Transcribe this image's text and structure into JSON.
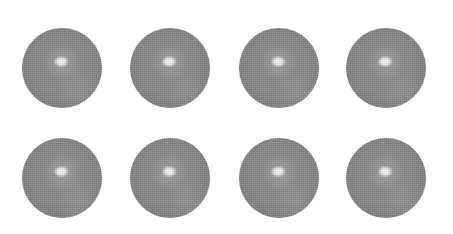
{
  "scene": {
    "description": "Eight gray glossy spheres arranged in a 2x4 grid on a white background",
    "background_color": "#ffffff",
    "sphere_color": "#8c8c8c",
    "highlight_color": "#ffffff",
    "sphere_diameter": 80,
    "rows": 2,
    "columns": 4
  },
  "spheres": [
    {
      "row": 1,
      "col": 1,
      "cx": 62,
      "cy": 68
    },
    {
      "row": 1,
      "col": 2,
      "cx": 170,
      "cy": 68
    },
    {
      "row": 1,
      "col": 3,
      "cx": 279,
      "cy": 68
    },
    {
      "row": 1,
      "col": 4,
      "cx": 386,
      "cy": 68
    },
    {
      "row": 2,
      "col": 1,
      "cx": 62,
      "cy": 178
    },
    {
      "row": 2,
      "col": 2,
      "cx": 170,
      "cy": 178
    },
    {
      "row": 2,
      "col": 3,
      "cx": 279,
      "cy": 178
    },
    {
      "row": 2,
      "col": 4,
      "cx": 386,
      "cy": 178
    }
  ]
}
